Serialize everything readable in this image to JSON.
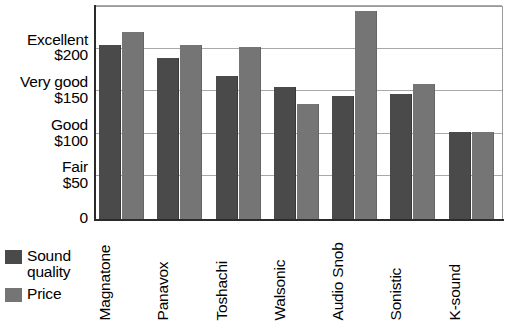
{
  "chart_data": {
    "type": "bar",
    "title": "",
    "xlabel": "",
    "ylabel": "",
    "ylim": [
      0,
      250
    ],
    "grid": true,
    "legend_position": "bottom-left",
    "categories": [
      "Magnatone",
      "Panavox",
      "Toshachi",
      "Walsonic",
      "Audio Snob",
      "Sonistic",
      "K-sound"
    ],
    "series": [
      {
        "name": "Sound quality",
        "color": "#4a4a4a",
        "values": [
          204,
          189,
          168,
          155,
          144,
          147,
          102
        ]
      },
      {
        "name": "Price",
        "color": "#757575",
        "values": [
          219,
          204,
          202,
          135,
          244,
          159,
          102
        ]
      }
    ],
    "y_ticks": [
      {
        "value": 0,
        "rating": "",
        "money": "0"
      },
      {
        "value": 50,
        "rating": "Fair",
        "money": "$50"
      },
      {
        "value": 100,
        "rating": "Good",
        "money": "$100"
      },
      {
        "value": 150,
        "rating": "Very good",
        "money": "$150"
      },
      {
        "value": 200,
        "rating": "Excellent",
        "money": "$200"
      },
      {
        "value": 250,
        "rating": "",
        "money": ""
      }
    ]
  },
  "legend": {
    "entries": [
      {
        "label": "Sound quality",
        "swatch": "sound"
      },
      {
        "label": "Price",
        "swatch": "price"
      }
    ]
  }
}
